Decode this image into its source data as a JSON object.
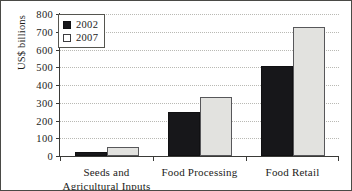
{
  "chart_data": {
    "type": "bar",
    "title": "",
    "xlabel": "",
    "ylabel": "US$ billions",
    "ylim": [
      0,
      800
    ],
    "yticks": [
      0,
      100,
      200,
      300,
      400,
      500,
      600,
      700,
      800
    ],
    "ytick_labels": [
      "0",
      "100",
      "200",
      "300",
      "400",
      "500",
      "600",
      "700",
      "800"
    ],
    "grid": true,
    "legend_position": "top-left",
    "categories": [
      "Seeds and Agricultural Inputs",
      "Food Processing",
      "Food Retail"
    ],
    "category_lines": [
      [
        "Seeds and",
        "Agricultural Inputs"
      ],
      [
        "Food Processing"
      ],
      [
        "Food Retail"
      ]
    ],
    "series": [
      {
        "name": "2002",
        "color": "#17171a",
        "values": [
          25,
          250,
          505
        ]
      },
      {
        "name": "2007",
        "color": "#e2e2df",
        "values": [
          50,
          335,
          725
        ]
      }
    ]
  },
  "legend": {
    "entries": [
      {
        "label": "2002",
        "swatch": "filled-square-icon"
      },
      {
        "label": "2007",
        "swatch": "outlined-square-icon"
      }
    ]
  }
}
